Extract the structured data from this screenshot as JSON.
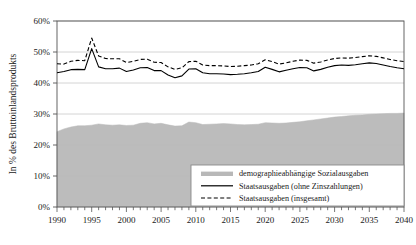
{
  "chart_data": {
    "type": "area",
    "title": "",
    "xlabel": "",
    "ylabel": "In % des Bruttoinlandsprodukts",
    "xlim": [
      1990,
      2040
    ],
    "ylim": [
      0,
      0.6
    ],
    "ytick_labels": [
      "0%",
      "10%",
      "20%",
      "30%",
      "40%",
      "50%",
      "60%"
    ],
    "ytick_values": [
      0,
      0.1,
      0.2,
      0.3,
      0.4,
      0.5,
      0.6
    ],
    "xtick_labels": [
      "1990",
      "1995",
      "2000",
      "2005",
      "2010",
      "2015",
      "2020",
      "2025",
      "2030",
      "2035",
      "2040"
    ],
    "xtick_values": [
      1990,
      1995,
      2000,
      2005,
      2010,
      2015,
      2020,
      2025,
      2030,
      2035,
      2040
    ],
    "minor_xticks_every": 1,
    "grid": "horizontal",
    "legend_position": "bottom-right",
    "x": [
      1990,
      1991,
      1992,
      1993,
      1994,
      1995,
      1996,
      1997,
      1998,
      1999,
      2000,
      2001,
      2002,
      2003,
      2004,
      2005,
      2006,
      2007,
      2008,
      2009,
      2010,
      2011,
      2012,
      2013,
      2014,
      2015,
      2016,
      2017,
      2018,
      2019,
      2020,
      2021,
      2022,
      2023,
      2024,
      2025,
      2026,
      2027,
      2028,
      2029,
      2030,
      2031,
      2032,
      2033,
      2034,
      2035,
      2036,
      2037,
      2038,
      2039,
      2040
    ],
    "series": [
      {
        "name": "demographieabhängige Sozialausgaben",
        "style": "area",
        "color": "#b8b8b8",
        "values": [
          0.243,
          0.252,
          0.258,
          0.262,
          0.262,
          0.264,
          0.268,
          0.265,
          0.264,
          0.265,
          0.263,
          0.264,
          0.27,
          0.272,
          0.268,
          0.27,
          0.265,
          0.261,
          0.262,
          0.274,
          0.272,
          0.266,
          0.267,
          0.268,
          0.269,
          0.268,
          0.266,
          0.265,
          0.266,
          0.267,
          0.272,
          0.271,
          0.27,
          0.271,
          0.273,
          0.275,
          0.278,
          0.281,
          0.284,
          0.287,
          0.29,
          0.292,
          0.294,
          0.296,
          0.297,
          0.299,
          0.3,
          0.301,
          0.302,
          0.302,
          0.303
        ]
      },
      {
        "name": "Staatsausgaben (ohne Zinszahlungen)",
        "style": "solid-line",
        "color": "#000000",
        "values": [
          0.433,
          0.437,
          0.443,
          0.444,
          0.443,
          0.511,
          0.452,
          0.446,
          0.446,
          0.448,
          0.437,
          0.442,
          0.449,
          0.45,
          0.44,
          0.44,
          0.426,
          0.417,
          0.423,
          0.445,
          0.446,
          0.433,
          0.43,
          0.43,
          0.429,
          0.427,
          0.428,
          0.43,
          0.433,
          0.437,
          0.451,
          0.444,
          0.436,
          0.441,
          0.446,
          0.45,
          0.449,
          0.439,
          0.444,
          0.451,
          0.456,
          0.458,
          0.457,
          0.459,
          0.462,
          0.465,
          0.463,
          0.458,
          0.453,
          0.449,
          0.446
        ]
      },
      {
        "name": "Staatsausgaben (insgesamt)",
        "style": "dashed-line",
        "color": "#000000",
        "values": [
          0.462,
          0.461,
          0.47,
          0.473,
          0.472,
          0.545,
          0.487,
          0.479,
          0.478,
          0.478,
          0.466,
          0.47,
          0.476,
          0.477,
          0.467,
          0.466,
          0.452,
          0.444,
          0.449,
          0.469,
          0.47,
          0.458,
          0.456,
          0.456,
          0.455,
          0.453,
          0.454,
          0.456,
          0.458,
          0.462,
          0.475,
          0.469,
          0.461,
          0.465,
          0.47,
          0.474,
          0.473,
          0.464,
          0.468,
          0.474,
          0.479,
          0.481,
          0.48,
          0.482,
          0.485,
          0.488,
          0.486,
          0.481,
          0.476,
          0.472,
          0.469
        ]
      }
    ],
    "legend_entries": [
      {
        "label": "demographieabhängige Sozialausgaben",
        "marker": "swatch"
      },
      {
        "label": "Staatsausgaben (ohne Zinszahlungen)",
        "marker": "solid-line"
      },
      {
        "label": "Staatsausgaben (insgesamt)",
        "marker": "dashed-line"
      }
    ]
  },
  "colors": {
    "area_fill": "#b8b8b8",
    "line": "#000000",
    "grid": "#c9c9c9",
    "axis": "#555555",
    "background": "#ffffff",
    "legend_border": "#8a8a8a"
  }
}
